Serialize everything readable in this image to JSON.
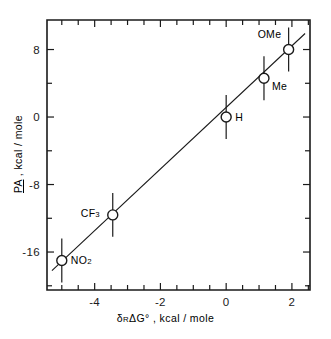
{
  "chart_data": {
    "type": "scatter",
    "title": "",
    "xlabel": "δR ΔG° , kcal / mole",
    "ylabel": "PA , kcal / mole",
    "xlim": [
      -5.45,
      2.55
    ],
    "ylim": [
      -20.5,
      11.5
    ],
    "grid": false,
    "legend": null,
    "x_ticklabels": [
      "-4",
      "-2",
      "0",
      "2"
    ],
    "x_ticklabel_values": [
      -4,
      -2,
      0,
      2
    ],
    "x_minor_tick_step": 0.5,
    "y_ticklabels": [
      "8",
      "0",
      "-8",
      "-16"
    ],
    "y_ticklabel_values": [
      8,
      0,
      -8,
      -16
    ],
    "y_minor_tick_step": 4,
    "points": [
      {
        "label": "NO2",
        "label_html": "NO<span class=\"sub\">2</span>",
        "x": -5.0,
        "y": -17.0,
        "yerr": 2.6,
        "label_pos": "right"
      },
      {
        "label": "CF3",
        "label_html": "CF<span class=\"sub\">3</span>",
        "x": -3.45,
        "y": -11.6,
        "yerr": 2.6,
        "label_pos": "left"
      },
      {
        "label": "H",
        "label_html": "H",
        "x": 0.0,
        "y": 0.0,
        "yerr": 2.6,
        "label_pos": "right"
      },
      {
        "label": "Me",
        "label_html": "Me",
        "x": 1.15,
        "y": 4.6,
        "yerr": 2.6,
        "label_pos": "right-below"
      },
      {
        "label": "OMe",
        "label_html": "OMe",
        "x": 1.9,
        "y": 8.0,
        "yerr": 2.6,
        "label_pos": "left-above"
      }
    ],
    "fit_line": {
      "x_start": -5.3,
      "y_start": -18.2,
      "x_end": 2.4,
      "y_end": 9.9
    },
    "colors": {
      "ink": "#1a1a1a",
      "background": "#ffffff",
      "marker_fill": "#ffffff"
    }
  },
  "axis_titles": {
    "x_prefix": "δ",
    "x_sub": "R",
    "x_rest": "ΔG° , kcal / mole",
    "y_underlined": "PA",
    "y_rest": " , kcal / mole"
  }
}
